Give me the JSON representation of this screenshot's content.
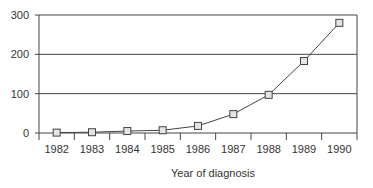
{
  "chart_data": {
    "type": "line",
    "title": "",
    "xlabel": "Year of diagnosis",
    "ylabel": "",
    "categories": [
      "1982",
      "1983",
      "1984",
      "1985",
      "1986",
      "1987",
      "1988",
      "1989",
      "1990"
    ],
    "series": [
      {
        "name": "Cases",
        "values": [
          1,
          2,
          5,
          7,
          18,
          48,
          97,
          183,
          280
        ],
        "marker": "square"
      }
    ],
    "ylim": [
      0,
      300
    ],
    "yticks": [
      0,
      100,
      200,
      300
    ],
    "ytick_labels": [
      "0",
      "100",
      "200",
      "300"
    ],
    "grid": {
      "horizontal": true,
      "vertical": false
    },
    "legend": null
  },
  "colors": {
    "line": "#444444",
    "marker_fill": "#e4e4e4",
    "marker_stroke": "#444444",
    "grid": "#444444",
    "axis": "#444444"
  }
}
